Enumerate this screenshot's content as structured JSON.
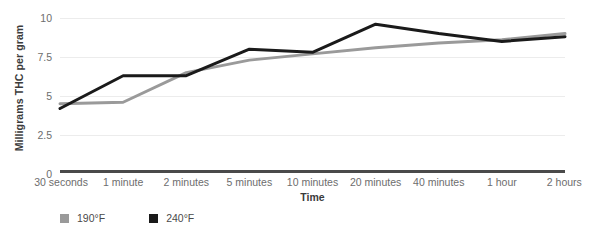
{
  "chart_data": {
    "type": "line",
    "title": "",
    "xlabel": "Time",
    "ylabel": "Milligrams THC per gram",
    "categories": [
      "30 seconds",
      "1 minute",
      "2 minutes",
      "5 minutes",
      "10 minutes",
      "20 minutes",
      "40 minutes",
      "1 hour",
      "2 hours"
    ],
    "ylim": [
      0,
      10
    ],
    "yticks": [
      0,
      2.5,
      5,
      7.5,
      10
    ],
    "ytick_labels": [
      "0",
      "2.5",
      "5",
      "7.5",
      "10"
    ],
    "grid": true,
    "legend_position": "bottom-left",
    "series": [
      {
        "name": "190°F",
        "color": "#9a9a9a",
        "values": [
          4.5,
          4.6,
          6.5,
          7.3,
          7.7,
          8.1,
          8.4,
          8.6,
          9.0
        ]
      },
      {
        "name": "240°F",
        "color": "#1a1a1a",
        "values": [
          4.2,
          6.3,
          6.3,
          8.0,
          7.8,
          9.6,
          9.0,
          8.5,
          8.8
        ]
      }
    ]
  },
  "colors": {
    "gridline": "#ececec",
    "axis": "#4a4a4a",
    "tick_text": "#6d6d6d",
    "title_text": "#3b3b3b",
    "background": "#ffffff"
  }
}
